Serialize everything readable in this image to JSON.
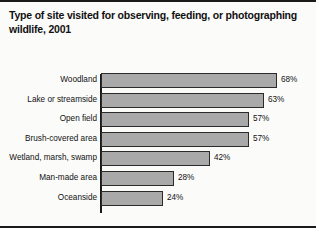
{
  "chart_data": {
    "type": "bar",
    "orientation": "horizontal",
    "title": "Type of site visited for observing, feeding, or photographing wildlife, 2001",
    "xlabel": "",
    "ylabel": "",
    "xlim": [
      0,
      100
    ],
    "grid": false,
    "legend": null,
    "value_suffix": "%",
    "categories": [
      "Woodland",
      "Lake or streamside",
      "Open field",
      "Brush-covered area",
      "Wetland, marsh, swamp",
      "Man-made area",
      "Oceanside"
    ],
    "values": [
      68,
      63,
      57,
      57,
      42,
      28,
      24
    ],
    "data_labels": [
      "68%",
      "63%",
      "57%",
      "57%",
      "42%",
      "28%",
      "24%"
    ],
    "bar_color": "#a9a9a9",
    "bar_edge_color": "#2b2b2b",
    "axis_color": "#1a1a1a",
    "background_color": "#fbfbfa",
    "text_color": "#111111"
  }
}
